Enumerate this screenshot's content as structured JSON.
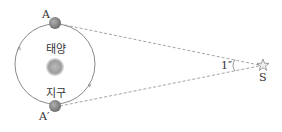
{
  "diagram": {
    "labels": {
      "position_a": "A",
      "position_a_prime": "A′",
      "sun": "태양",
      "earth": "지구",
      "parallax_angle": "1″",
      "star": "S"
    },
    "colors": {
      "orbit": "#8a8a8a",
      "dashed_line": "#9a9a9a",
      "earth": "#8c8c8c",
      "sun": "#a0a0a0",
      "star": "#9a9a9a",
      "text": "#333333"
    }
  }
}
